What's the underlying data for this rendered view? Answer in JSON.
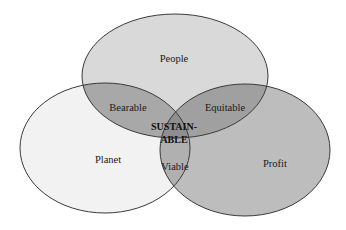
{
  "diagram": {
    "type": "venn",
    "sets": [
      {
        "id": "people",
        "label": "People",
        "fill": "#d9d9d9"
      },
      {
        "id": "planet",
        "label": "Planet",
        "fill": "#f2f2f2"
      },
      {
        "id": "profit",
        "label": "Profit",
        "fill": "#bdbdbd"
      }
    ],
    "intersections": [
      {
        "sets": [
          "people",
          "planet"
        ],
        "label": "Bearable",
        "fill": "#a8a8a8"
      },
      {
        "sets": [
          "people",
          "profit"
        ],
        "label": "Equitable",
        "fill": "#a0a0a0"
      },
      {
        "sets": [
          "planet",
          "profit"
        ],
        "label": "Viable",
        "fill": "#b0b0b0"
      },
      {
        "sets": [
          "people",
          "planet",
          "profit"
        ],
        "label_line1": "SUSTAIN-",
        "label_line2": "ABLE",
        "fill": "#8e8e8e"
      }
    ],
    "outline_color": "#3a3a3a",
    "background": "#ffffff"
  }
}
